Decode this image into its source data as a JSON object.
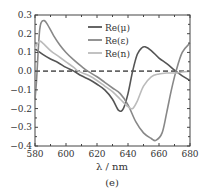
{
  "chart_data": {
    "type": "line",
    "title": "",
    "panel_label": "(e)",
    "xlabel": "λ / nm",
    "ylabel": "",
    "xlim": [
      580,
      680
    ],
    "ylim": [
      -0.4,
      0.3
    ],
    "xticks": [
      580,
      600,
      620,
      640,
      660,
      680
    ],
    "xtick_labels": [
      "580",
      "600",
      "620",
      "640",
      "660",
      "680"
    ],
    "yticks": [
      0.3,
      0.2,
      0.1,
      0.0,
      -0.1,
      -0.2,
      -0.3,
      -0.4
    ],
    "ytick_labels": [
      "0.3",
      "0.2",
      "0.1",
      "0.0",
      "−0.1",
      "−0.2",
      "−0.3",
      "−0.4"
    ],
    "grid": false,
    "legend_position": "upper center",
    "reference_line": {
      "y": 0.0,
      "style": "dashed",
      "color": "#666666"
    },
    "series": [
      {
        "name": "Re(μ)",
        "color": "#555555",
        "x": [
          580,
          585,
          590,
          595,
          600,
          605,
          610,
          615,
          620,
          625,
          630,
          634,
          637,
          640,
          643,
          646,
          649,
          651,
          655,
          660,
          665,
          670,
          675,
          680
        ],
        "values": [
          0.12,
          0.09,
          0.065,
          0.045,
          0.02,
          0.0,
          -0.025,
          -0.045,
          -0.07,
          -0.1,
          -0.15,
          -0.21,
          -0.2,
          -0.12,
          0.0,
          0.09,
          0.125,
          0.13,
          0.11,
          0.07,
          0.04,
          0.005,
          -0.025,
          -0.05
        ]
      },
      {
        "name": "Re(ε)",
        "color": "#888888",
        "x": [
          580,
          581,
          582,
          583,
          584,
          586,
          588,
          592,
          596,
          600,
          605,
          610,
          614,
          620,
          625,
          630,
          635,
          640,
          645,
          650,
          655,
          658,
          662,
          665,
          668,
          671,
          675,
          680
        ],
        "values": [
          -0.15,
          -0.05,
          0.1,
          0.22,
          0.26,
          0.27,
          0.25,
          0.19,
          0.14,
          0.1,
          0.06,
          0.025,
          0.0,
          -0.03,
          -0.06,
          -0.09,
          -0.12,
          -0.18,
          -0.27,
          -0.33,
          -0.36,
          -0.37,
          -0.33,
          -0.22,
          -0.1,
          0.0,
          0.1,
          0.15
        ]
      },
      {
        "name": "Re(n)",
        "color": "#bbbbbb",
        "x": [
          580,
          581,
          583,
          585,
          590,
          595,
          600,
          605,
          608,
          615,
          620,
          625,
          630,
          635,
          640,
          643,
          646,
          650,
          655,
          660,
          665,
          670,
          675,
          680
        ],
        "values": [
          0.12,
          0.14,
          0.16,
          0.15,
          0.11,
          0.08,
          0.05,
          0.02,
          0.0,
          -0.025,
          -0.05,
          -0.08,
          -0.11,
          -0.15,
          -0.19,
          -0.2,
          -0.16,
          -0.08,
          -0.03,
          -0.015,
          -0.01,
          -0.01,
          -0.005,
          0.0
        ]
      }
    ]
  }
}
